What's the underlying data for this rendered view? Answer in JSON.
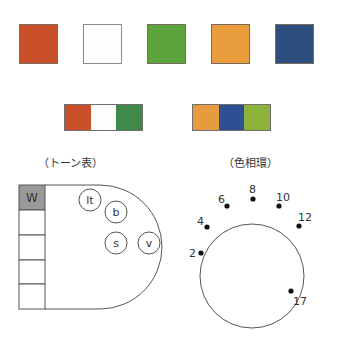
{
  "swatches": [
    {
      "name": "red-orange",
      "color": "#c9502a"
    },
    {
      "name": "white",
      "color": "#fdfdfb"
    },
    {
      "name": "green",
      "color": "#5ba33a"
    },
    {
      "name": "orange",
      "color": "#e99d3d"
    },
    {
      "name": "navy",
      "color": "#2d4f7e"
    }
  ],
  "combos": [
    {
      "colors": [
        "#c9502a",
        "#fdfdfb",
        "#3f8a4a"
      ]
    },
    {
      "colors": [
        "#e69b3e",
        "#2f4f93",
        "#8db33d"
      ]
    }
  ],
  "tone_chart": {
    "caption": "（トーン表）",
    "column_top_label": "W",
    "column_top_color": "#999999",
    "tones": [
      {
        "label": "lt",
        "cx": 90,
        "cy": 200
      },
      {
        "label": "b",
        "cx": 116,
        "cy": 212
      },
      {
        "label": "s",
        "cx": 116,
        "cy": 243
      },
      {
        "label": "v",
        "cx": 149,
        "cy": 243
      }
    ]
  },
  "hue_circle": {
    "caption": "（色相環）",
    "points": [
      {
        "label": "2",
        "x": 201,
        "y": 253,
        "lx": 189,
        "ly": 257
      },
      {
        "label": "4",
        "x": 207,
        "y": 227,
        "lx": 197,
        "ly": 225
      },
      {
        "label": "6",
        "x": 227,
        "y": 206,
        "lx": 218,
        "ly": 203
      },
      {
        "label": "8",
        "x": 253,
        "y": 199,
        "lx": 249,
        "ly": 193
      },
      {
        "label": "10",
        "x": 279,
        "y": 206,
        "lx": 276,
        "ly": 201
      },
      {
        "label": "12",
        "x": 299,
        "y": 226,
        "lx": 298,
        "ly": 221
      },
      {
        "label": "17",
        "x": 291,
        "y": 291,
        "lx": 293,
        "ly": 305
      }
    ]
  }
}
